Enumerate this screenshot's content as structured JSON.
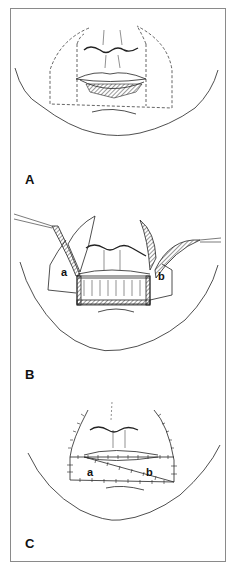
{
  "figure": {
    "panels": [
      {
        "id": "A",
        "label": "A"
      },
      {
        "id": "B",
        "label": "B",
        "flap_labels": [
          "a",
          "b"
        ]
      },
      {
        "id": "C",
        "label": "C",
        "flap_labels": [
          "a",
          "b"
        ]
      }
    ],
    "colors": {
      "line": "#222222",
      "frame": "#8a8a8a",
      "hatch": "#333333",
      "background": "#ffffff"
    }
  }
}
